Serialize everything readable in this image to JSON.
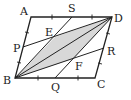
{
  "diagram": {
    "type": "parallelogram-geometry",
    "labels": {
      "A": "A",
      "B": "B",
      "C": "C",
      "D": "D",
      "S": "S",
      "P": "P",
      "R": "R",
      "Q": "Q",
      "E": "E",
      "F": "F"
    },
    "colors": {
      "stroke": "#222222",
      "shade": "#d8d8d8",
      "background": "#ffffff"
    },
    "points": {
      "A": [
        31,
        17
      ],
      "D": [
        112,
        17
      ],
      "B": [
        15,
        78
      ],
      "C": [
        95,
        78
      ],
      "S": [
        72,
        17
      ],
      "P": [
        23,
        47
      ],
      "R": [
        104,
        48
      ],
      "Q": [
        55,
        78
      ],
      "E": [
        55,
        37
      ],
      "F": [
        73,
        59
      ]
    },
    "shaded_region": "B-E-D-F",
    "segments": [
      "AD",
      "DC",
      "CB",
      "BA",
      "BD",
      "BS",
      "DQ",
      "PD",
      "BR"
    ]
  }
}
